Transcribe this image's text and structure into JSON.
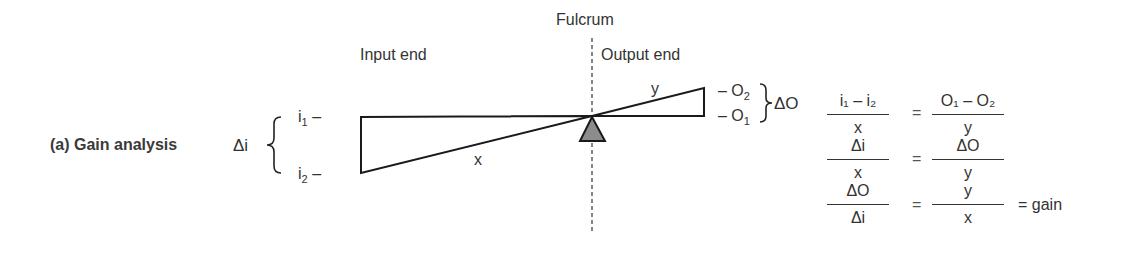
{
  "figure": {
    "title": "(a) Gain analysis",
    "labels": {
      "fulcrum": "Fulcrum",
      "input_end": "Input end",
      "output_end": "Output end",
      "x_arm": "x",
      "y_arm": "y",
      "delta_i": "Δi",
      "delta_o": "ΔO",
      "i1": "i",
      "i1_sub": "1",
      "i2": "i",
      "i2_sub": "2",
      "o1": "O",
      "o1_sub": "1",
      "o2": "O",
      "o2_sub": "2",
      "tick": "–"
    },
    "equations": [
      {
        "lhs_num": "i₁ – i₂",
        "lhs_den": "x",
        "rhs_num": "O₁ – O₂",
        "rhs_den": "y",
        "eq": "=",
        "tail": ""
      },
      {
        "lhs_num": "Δi",
        "lhs_den": "x",
        "rhs_num": "ΔO",
        "rhs_den": "y",
        "eq": "=",
        "tail": ""
      },
      {
        "lhs_num": "ΔO",
        "lhs_den": "Δi",
        "rhs_num": "y",
        "rhs_den": "x",
        "eq": "=",
        "tail": "= gain"
      }
    ],
    "colors": {
      "line": "#1a1a1a",
      "fulcrum_fill": "#8c8c8c",
      "text": "#333333"
    }
  }
}
